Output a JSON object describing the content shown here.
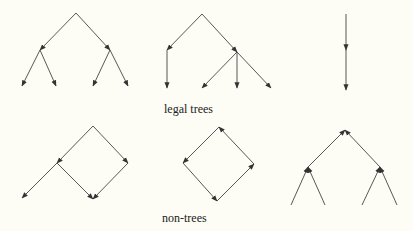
{
  "labels": {
    "legal": "legal trees",
    "non": "non-trees"
  },
  "colors": {
    "background": "#fdfdf6",
    "line": "#444444",
    "text": "#222222"
  },
  "diagrams": {
    "legal_trees": [
      {
        "name": "binary-tree",
        "nodes": [
          [
            76,
            13
          ],
          [
            40,
            50
          ],
          [
            110,
            50
          ],
          [
            22,
            86
          ],
          [
            56,
            86
          ],
          [
            93,
            86
          ],
          [
            128,
            86
          ]
        ],
        "edges": [
          [
            0,
            1
          ],
          [
            0,
            2
          ],
          [
            1,
            3
          ],
          [
            1,
            4
          ],
          [
            2,
            5
          ],
          [
            2,
            6
          ]
        ]
      },
      {
        "name": "mixed-tree",
        "nodes": [
          [
            202,
            14
          ],
          [
            167,
            50
          ],
          [
            237,
            52
          ],
          [
            167,
            88
          ],
          [
            202,
            88
          ],
          [
            237,
            88
          ],
          [
            271,
            88
          ]
        ],
        "edges": [
          [
            0,
            1
          ],
          [
            0,
            2
          ],
          [
            1,
            3
          ],
          [
            2,
            4
          ],
          [
            2,
            5
          ],
          [
            2,
            6
          ]
        ]
      },
      {
        "name": "chain",
        "nodes": [
          [
            346,
            14
          ],
          [
            346,
            50
          ],
          [
            346,
            90
          ]
        ],
        "edges": [
          [
            0,
            1
          ],
          [
            1,
            2
          ]
        ]
      }
    ],
    "non_trees": [
      {
        "name": "shared-child",
        "nodes": [
          [
            93,
            126
          ],
          [
            57,
            163
          ],
          [
            128,
            163
          ],
          [
            22,
            198
          ],
          [
            93,
            199
          ]
        ],
        "edges": [
          [
            0,
            1
          ],
          [
            0,
            2
          ],
          [
            1,
            3
          ],
          [
            1,
            4
          ],
          [
            2,
            4
          ]
        ]
      },
      {
        "name": "cycle",
        "nodes": [
          [
            219,
            127
          ],
          [
            183,
            163
          ],
          [
            217,
            201
          ],
          [
            254,
            164
          ]
        ],
        "edges": [
          [
            0,
            1
          ],
          [
            1,
            2
          ],
          [
            2,
            3
          ],
          [
            3,
            0
          ]
        ]
      },
      {
        "name": "inverted-tree",
        "nodes": [
          [
            345,
            130
          ],
          [
            308,
            167
          ],
          [
            380,
            167
          ],
          [
            291,
            205
          ],
          [
            325,
            205
          ],
          [
            362,
            205
          ],
          [
            397,
            205
          ]
        ],
        "edges": [
          [
            1,
            0
          ],
          [
            2,
            0
          ],
          [
            3,
            1
          ],
          [
            4,
            1
          ],
          [
            5,
            2
          ],
          [
            6,
            2
          ]
        ]
      }
    ]
  }
}
